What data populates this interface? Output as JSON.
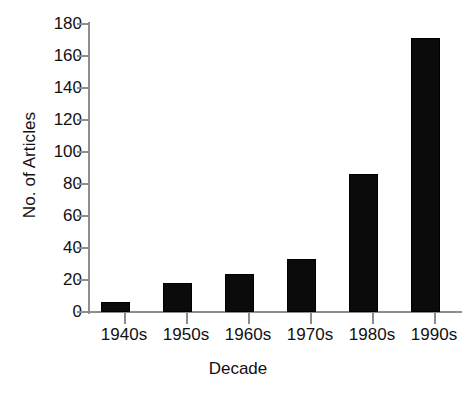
{
  "chart_data": {
    "type": "bar",
    "title": "",
    "xlabel": "Decade",
    "ylabel": "No. of Articles",
    "categories": [
      "1940s",
      "1950s",
      "1960s",
      "1970s",
      "1980s",
      "1990s"
    ],
    "values": [
      6,
      18,
      24,
      33,
      86,
      171
    ],
    "series": [
      {
        "name": "No. of Articles",
        "values": [
          6,
          18,
          24,
          33,
          86,
          171
        ]
      }
    ],
    "ylim": [
      0,
      180
    ],
    "ytick_step": 20,
    "yticks": [
      0,
      20,
      40,
      60,
      80,
      100,
      120,
      140,
      160,
      180
    ],
    "ytick_labels": [
      "0",
      "20",
      "40",
      "60",
      "80",
      "100",
      "120",
      "140",
      "160",
      "180"
    ],
    "grid": false,
    "legend": false,
    "legend_position": "none",
    "bar_color": "#0b0b0b",
    "axis_color": "#8d8d8d",
    "background_color": "#ffffff",
    "text_color": "#111111"
  },
  "caption": {
    "fragment": " "
  }
}
